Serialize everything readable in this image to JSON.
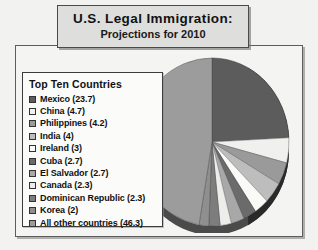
{
  "title": {
    "line1": "U.S. Legal Immigration:",
    "line2": "Projections for 2010"
  },
  "legend": {
    "heading": "Top Ten Countries"
  },
  "chart_data": {
    "type": "pie",
    "title": "U.S. Legal Immigration: Projections for 2010",
    "subtitle": "Projections for 2010",
    "legend_title": "Top Ten Countries",
    "legend_position": "left",
    "units": "percent",
    "categories": [
      "Mexico",
      "China",
      "Philippines",
      "India",
      "Ireland",
      "Cuba",
      "El Salvador",
      "Canada",
      "Dominican Republic",
      "Korea",
      "All other countries"
    ],
    "values": [
      23.7,
      4.7,
      4.2,
      4,
      3,
      2.7,
      2.7,
      2.3,
      2.3,
      2,
      46.3
    ],
    "colors": [
      "#5c5c5c",
      "#f0f0ee",
      "#9a9a9a",
      "#bdbdbd",
      "#fafaf8",
      "#6b6b6b",
      "#a8a8a8",
      "#ededeb",
      "#7d7d7d",
      "#8f8f8f",
      "#9c9c9c"
    ],
    "slices": [
      {
        "label": "Mexico (23.7)",
        "name": "Mexico",
        "value": 23.7,
        "color": "#5c5c5c"
      },
      {
        "label": "China (4.7)",
        "name": "China",
        "value": 4.7,
        "color": "#f0f0ee"
      },
      {
        "label": "Philippines (4.2)",
        "name": "Philippines",
        "value": 4.2,
        "color": "#9a9a9a"
      },
      {
        "label": "India (4)",
        "name": "India",
        "value": 4,
        "color": "#bdbdbd"
      },
      {
        "label": "Ireland (3)",
        "name": "Ireland",
        "value": 3,
        "color": "#fafaf8"
      },
      {
        "label": "Cuba (2.7)",
        "name": "Cuba",
        "value": 2.7,
        "color": "#6b6b6b"
      },
      {
        "label": "El Salvador (2.7)",
        "name": "El Salvador",
        "value": 2.7,
        "color": "#a8a8a8"
      },
      {
        "label": "Canada (2.3)",
        "name": "Canada",
        "value": 2.3,
        "color": "#ededeb"
      },
      {
        "label": "Dominican Republic (2.3)",
        "name": "Dominican Republic",
        "value": 2.3,
        "color": "#7d7d7d"
      },
      {
        "label": "Korea (2)",
        "name": "Korea",
        "value": 2,
        "color": "#8f8f8f"
      },
      {
        "label": "All other countries (46.3)",
        "name": "All other countries",
        "value": 46.3,
        "color": "#9c9c9c"
      }
    ]
  }
}
